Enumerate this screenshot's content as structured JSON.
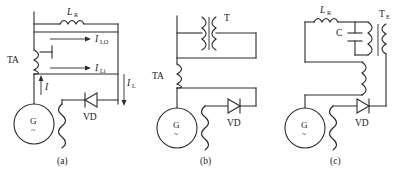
{
  "figure": {
    "type": "circuit-diagram-set",
    "panel_count": 3,
    "background_color": "#ffffff",
    "line_color": "#2b2b2b",
    "text_color": "#1a1a1a"
  },
  "panels": [
    {
      "id": "a",
      "caption": "(a)",
      "labels": {
        "inductor": "L",
        "inductor_sub": "R",
        "current_transformer": "TA",
        "generator": "G",
        "generator_mark": "~",
        "diode": "VD",
        "current_source": "I",
        "current_lo": "I",
        "current_lo_sub": "LO",
        "current_li": "I",
        "current_li_sub": "Li",
        "current_l": "I",
        "current_l_sub": "L"
      }
    },
    {
      "id": "b",
      "caption": "(b)",
      "labels": {
        "transformer": "T",
        "current_transformer": "TA",
        "generator": "G",
        "generator_mark": "~",
        "diode": "VD"
      }
    },
    {
      "id": "c",
      "caption": "(c)",
      "labels": {
        "inductor": "L",
        "inductor_sub": "R",
        "capacitor": "C",
        "transformer": "T",
        "transformer_sub": "E",
        "generator": "G",
        "generator_mark": "~",
        "diode": "VD"
      }
    }
  ]
}
